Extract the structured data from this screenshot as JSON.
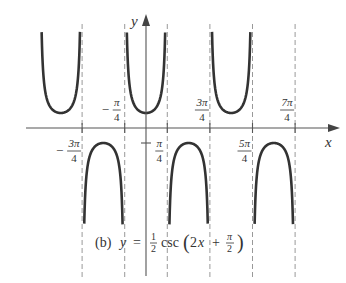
{
  "chart_data": {
    "type": "line",
    "caption": {
      "prefix": "(b)",
      "lhs": "y",
      "eq": "=",
      "coef_num": "1",
      "coef_den": "2",
      "func": "csc",
      "arg_open": "(2",
      "arg_var": "x",
      "arg_plus": "+",
      "arg_frac_num": "π",
      "arg_frac_den": "2",
      "arg_close": ")"
    },
    "xlabel": "x",
    "ylabel": "y",
    "function": "y = (1/2) csc(2x + pi/2)",
    "asymptotes_x": [
      "-3π/4",
      "-π/4",
      "π/4",
      "3π/4",
      "5π/4",
      "7π/4"
    ],
    "asymptote_values": [
      -2.356,
      -0.785,
      0.785,
      2.356,
      3.927,
      5.498
    ],
    "tick_labels": [
      {
        "num": "3π",
        "den": "4",
        "sign": "−",
        "x": -2.356,
        "position": "below"
      },
      {
        "num": "π",
        "den": "4",
        "sign": "−",
        "x": -0.785,
        "position": "above"
      },
      {
        "num": "π",
        "den": "4",
        "sign": "",
        "x": 0.785,
        "position": "below"
      },
      {
        "num": "3π",
        "den": "4",
        "sign": "",
        "x": 2.356,
        "position": "above"
      },
      {
        "num": "5π",
        "den": "4",
        "sign": "",
        "x": 3.927,
        "position": "below"
      },
      {
        "num": "7π",
        "den": "4",
        "sign": "",
        "x": 5.498,
        "position": "above"
      }
    ],
    "branches": [
      {
        "type": "upper",
        "vertex_x": -3.142,
        "vertex_y": 0.5,
        "from": -3.927,
        "to": -2.356
      },
      {
        "type": "lower",
        "vertex_x": -1.571,
        "vertex_y": -0.5,
        "from": -2.356,
        "to": -0.785
      },
      {
        "type": "upper",
        "vertex_x": 0,
        "vertex_y": 0.5,
        "from": -0.785,
        "to": 0.785
      },
      {
        "type": "lower",
        "vertex_x": 1.571,
        "vertex_y": -0.5,
        "from": 0.785,
        "to": 2.356
      },
      {
        "type": "upper",
        "vertex_x": 3.142,
        "vertex_y": 0.5,
        "from": 2.356,
        "to": 3.927
      },
      {
        "type": "lower",
        "vertex_x": 4.712,
        "vertex_y": -0.5,
        "from": 3.927,
        "to": 5.498
      }
    ],
    "y_marks": [
      0.5,
      -0.5
    ],
    "grid": false,
    "legend": "none"
  },
  "style": {
    "curve_color": "#333333",
    "axis_color": "#555555",
    "asymptote_color": "#999999"
  }
}
